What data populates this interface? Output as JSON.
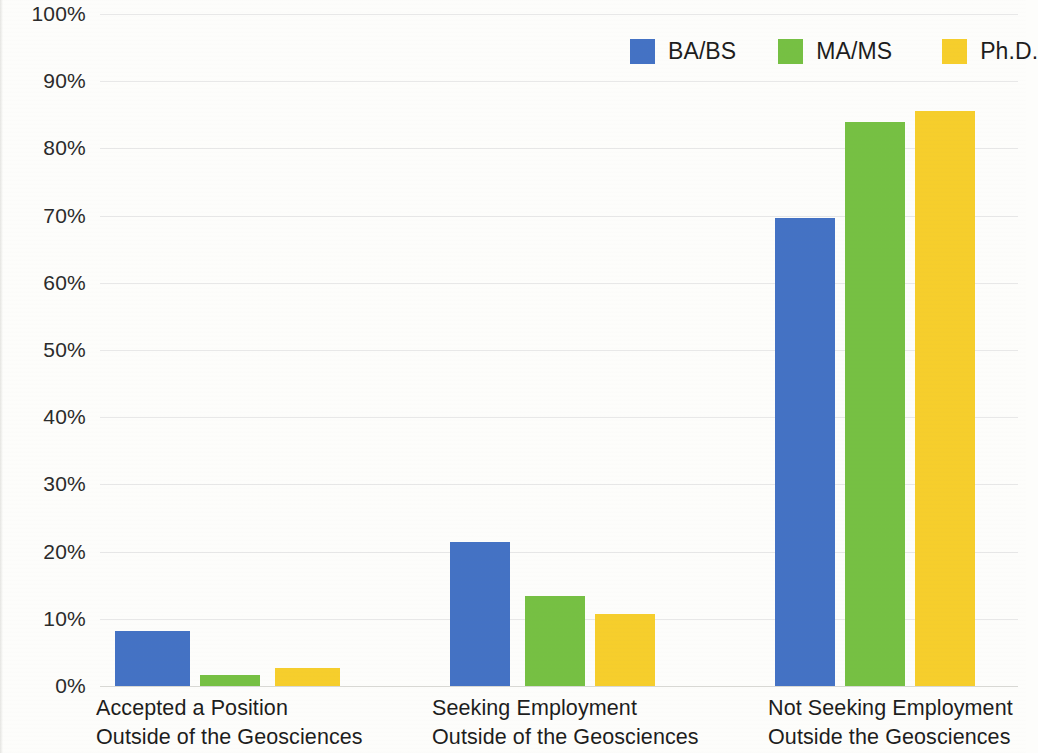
{
  "chart_data": {
    "type": "bar",
    "title": "",
    "subtitle": "",
    "xlabel": "",
    "ylabel": "",
    "ylim": [
      0,
      100
    ],
    "y_unit": "%",
    "grid": true,
    "legend_position": "top-right",
    "orientation": "vertical",
    "grouping": "grouped",
    "categories": [
      "Accepted a Position Outside of the Geosciences",
      "Seeking Employment Outside of the Geosciences",
      "Not Seeking Employment Outside the Geosciences"
    ],
    "category_lines": [
      [
        "Accepted a Position",
        "Outside of the Geosciences"
      ],
      [
        "Seeking Employment",
        "Outside of the Geosciences"
      ],
      [
        "Not Seeking Employment",
        "Outside the Geosciences"
      ]
    ],
    "series": [
      {
        "name": "BA/BS",
        "color": "#4472C4",
        "values": [
          8.2,
          21.4,
          69.6
        ]
      },
      {
        "name": "MA/MS",
        "color": "#76C043",
        "values": [
          1.6,
          13.4,
          83.9
        ]
      },
      {
        "name": "Ph.D.",
        "color": "#F6CE2C",
        "values": [
          2.7,
          10.7,
          85.6
        ]
      }
    ],
    "y_ticks": [
      0,
      10,
      20,
      30,
      40,
      50,
      60,
      70,
      80,
      90,
      100
    ],
    "y_tick_labels": [
      "0%",
      "10%",
      "20%",
      "30%",
      "40%",
      "50%",
      "60%",
      "70%",
      "80%",
      "90%",
      "100%"
    ]
  },
  "legend": {
    "items": [
      {
        "label": "BA/BS",
        "color": "#4472C4"
      },
      {
        "label": "MA/MS",
        "color": "#76C043"
      },
      {
        "label": "Ph.D.",
        "color": "#F6CE2C"
      }
    ]
  },
  "colors": {
    "background": "#fdfdfb",
    "gridline": "#e8e8e8",
    "baseline": "#d8d8d4",
    "text": "#1d1d1d",
    "axis_text": "#2b2b2b"
  }
}
